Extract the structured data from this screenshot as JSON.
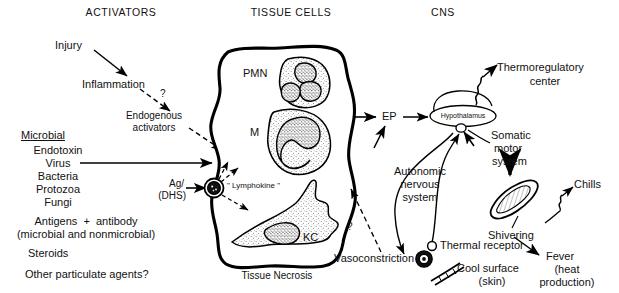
{
  "diagram": {
    "background_color": "#ffffff",
    "ink_color": "#000000",
    "width": 619,
    "height": 293,
    "columns": [
      {
        "id": "activators",
        "label": "ACTIVATORS"
      },
      {
        "id": "tissue_cells",
        "label": "TISSUE CELLS"
      },
      {
        "id": "cns",
        "label": "CNS"
      }
    ]
  },
  "activators": {
    "injury": "Injury",
    "inflammation": "Inflammation",
    "question_mark_1": "?",
    "endogenous_activators_line1": "Endogenous",
    "endogenous_activators_line2": "activators",
    "microbial_heading": "Microbial",
    "microbial_items": [
      "Endotoxin",
      "Virus",
      "Bacteria",
      "Protozoa",
      "Fungi"
    ],
    "antigens_line1": "Antigens  +  antibody",
    "antigens_line2": "(microbial and nonmicrobial)",
    "steroids": "Steroids",
    "other_agents": "Other particulate agents?"
  },
  "tissue": {
    "pmn_label": "PMN",
    "macrophage_label": "M",
    "kupffer_label": "KC",
    "lymphokine_label": "\" Lymphokine \"",
    "ag_dhs_line1": "Ag/",
    "ag_dhs_line2": "(DHS)",
    "tissue_necrosis": "Tissue Necrosis",
    "ep_label": "EP",
    "question_mark_2": "?"
  },
  "cns": {
    "hypothalamus": "Hypothalamus",
    "thermoregulatory_line1": "Thermoregulatory",
    "thermoregulatory_line2": "center",
    "somatic_line1": "Somatic",
    "somatic_line2": "motor",
    "somatic_line3": "system",
    "autonomic_line1": "Autonomic",
    "autonomic_line2": "nervous",
    "autonomic_line3": "system",
    "thermal_receptor": "Thermal receptor",
    "vasoconstriction": "Vasoconstriction",
    "cool_surface_line1": "Cool surface",
    "cool_surface_line2": "(skin)",
    "shivering": "Shivering",
    "chills": "Chills",
    "fever_line1": "Fever",
    "fever_line2": "(heat",
    "fever_line3": "production)"
  },
  "icons": {
    "pmn_cell": "polymorphonuclear-leukocyte",
    "macrophage_cell": "macrophage",
    "kupffer_cell": "kupffer-cell",
    "lymphocyte": "lymphocyte",
    "muscle_fiber": "skeletal-muscle-fiber",
    "vessel_cross_section": "constricted-vessel",
    "skin_vessel": "skin-blood-vessel",
    "receptor_dot": "thermal-receptor-node"
  }
}
